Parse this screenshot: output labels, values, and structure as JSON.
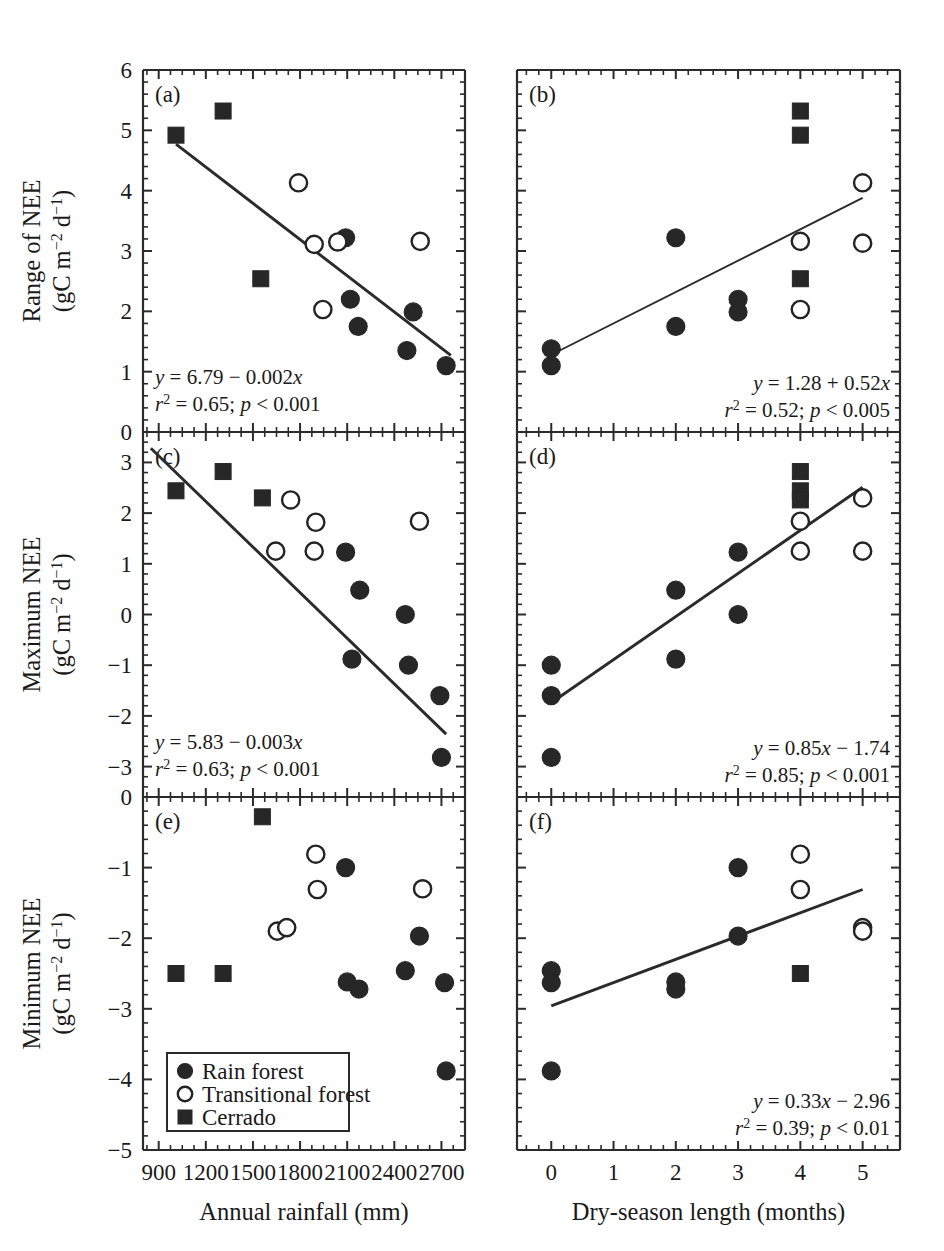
{
  "figure": {
    "title": "",
    "panels": [
      "a",
      "b",
      "c",
      "d",
      "e",
      "f"
    ]
  },
  "axes": {
    "x_left": {
      "label": "Annual rainfall (mm)",
      "ticks": [
        "900",
        "1200",
        "1500",
        "1800",
        "2100",
        "2400",
        "2700"
      ],
      "min": 800,
      "max": 2850,
      "minor_per_major": 3
    },
    "x_right": {
      "label": "Dry-season length (months)",
      "ticks": [
        "0",
        "1",
        "2",
        "3",
        "4",
        "5"
      ],
      "min": -0.55,
      "max": 5.6,
      "minor_per_major": 4
    },
    "y_row1": {
      "label_line1": "Range of NEE",
      "label_line2_pre": "(gC m",
      "label_line2_sup1": "−2",
      "label_line2_mid": " d",
      "label_line2_sup2": "−1",
      "label_line2_post": ")",
      "ticks": [
        "6",
        "5",
        "4",
        "3",
        "2",
        "1",
        "0"
      ],
      "min": 0,
      "max": 6
    },
    "y_row2": {
      "label_line1": "Maximum NEE",
      "label_line2_pre": "(gC m",
      "label_line2_sup1": "−2",
      "label_line2_mid": " d",
      "label_line2_sup2": "−1",
      "label_line2_post": ")",
      "ticks": [
        "3",
        "2",
        "1",
        "0",
        "−1",
        "−2",
        "−3"
      ],
      "min": -3.6,
      "max": 3.6
    },
    "y_row3": {
      "label_line1": "Minimum NEE",
      "label_line2_pre": "(gC m",
      "label_line2_sup1": "−2",
      "label_line2_mid": " d",
      "label_line2_sup2": "−1",
      "label_line2_post": ")",
      "ticks": [
        "0",
        "−1",
        "−2",
        "−3",
        "−4",
        "−5"
      ],
      "min": -5,
      "max": 0
    }
  },
  "legend": {
    "items": [
      {
        "marker": "filled-circle",
        "label": "Rain forest"
      },
      {
        "marker": "open-circle",
        "label": "Transitional forest"
      },
      {
        "marker": "filled-square",
        "label": "Cerrado"
      }
    ]
  },
  "annotations": {
    "a": {
      "eq": "y = 6.79 − 0.002x",
      "stats_r": "r",
      "stats_rest": " = 0.65; p < 0.001"
    },
    "b": {
      "eq": "y = 1.28 + 0.52x",
      "stats_r": "r",
      "stats_rest": " = 0.52; p < 0.005"
    },
    "c": {
      "eq": "y = 5.83 − 0.003x",
      "stats_r": "r",
      "stats_rest": " = 0.63; p < 0.001"
    },
    "d": {
      "eq": "y = 0.85x − 1.74",
      "stats_r": "r",
      "stats_rest": " = 0.85; p < 0.001"
    },
    "e": {
      "eq": "",
      "stats_r": "",
      "stats_rest": ""
    },
    "f": {
      "eq": "y = 0.33x − 2.96",
      "stats_r": "r",
      "stats_rest": " = 0.39; p < 0.01"
    }
  },
  "chart_data": [
    {
      "id": "a",
      "type": "scatter",
      "title": "(a)",
      "xlabel": "Annual rainfall (mm)",
      "ylabel": "Range of NEE (gC m-2 d-1)",
      "xlim": [
        800,
        2850
      ],
      "ylim": [
        0,
        6
      ],
      "grid": false,
      "legend_position": "none",
      "fit": {
        "equation": "y = 6.79 - 0.002x",
        "r2": 0.65,
        "p": "< 0.001",
        "x_start": 1010,
        "x_end": 2760
      },
      "series": [
        {
          "name": "Rain forest",
          "marker": "filled-circle",
          "points": [
            [
              2090,
              3.22
            ],
            [
              2120,
              2.2
            ],
            [
              2170,
              1.75
            ],
            [
              2520,
              1.99
            ],
            [
              2480,
              1.35
            ],
            [
              2730,
              1.1
            ]
          ]
        },
        {
          "name": "Transitional forest",
          "marker": "open-circle",
          "points": [
            [
              1790,
              4.13
            ],
            [
              1890,
              3.11
            ],
            [
              2040,
              3.15
            ],
            [
              1945,
              2.03
            ],
            [
              2565,
              3.16
            ]
          ]
        },
        {
          "name": "Cerrado",
          "marker": "filled-square",
          "points": [
            [
              1010,
              4.92
            ],
            [
              1310,
              5.32
            ],
            [
              1550,
              2.54
            ]
          ]
        }
      ]
    },
    {
      "id": "b",
      "type": "scatter",
      "title": "(b)",
      "xlabel": "Dry-season length (months)",
      "ylabel": "Range of NEE (gC m-2 d-1)",
      "xlim": [
        -0.55,
        5.6
      ],
      "ylim": [
        0,
        6
      ],
      "grid": false,
      "legend_position": "none",
      "fit": {
        "equation": "y = 1.28 + 0.52x",
        "r2": 0.52,
        "p": "< 0.005",
        "x_start": 0,
        "x_end": 5
      },
      "series": [
        {
          "name": "Rain forest",
          "marker": "filled-circle",
          "points": [
            [
              0,
              1.38
            ],
            [
              0,
              1.1
            ],
            [
              2,
              3.22
            ],
            [
              2,
              1.75
            ],
            [
              3,
              2.2
            ],
            [
              3,
              1.99
            ]
          ]
        },
        {
          "name": "Transitional forest",
          "marker": "open-circle",
          "points": [
            [
              4,
              3.16
            ],
            [
              4,
              2.03
            ],
            [
              5,
              4.13
            ],
            [
              5,
              3.13
            ]
          ]
        },
        {
          "name": "Cerrado",
          "marker": "filled-square",
          "points": [
            [
              4,
              5.32
            ],
            [
              4,
              4.92
            ],
            [
              4,
              2.54
            ]
          ]
        }
      ]
    },
    {
      "id": "c",
      "type": "scatter",
      "title": "(c)",
      "xlabel": "Annual rainfall (mm)",
      "ylabel": "Maximum NEE (gC m-2 d-1)",
      "xlim": [
        800,
        2850
      ],
      "ylim": [
        -3.6,
        3.6
      ],
      "grid": false,
      "legend_position": "none",
      "fit": {
        "equation": "y = 5.83 - 0.003x",
        "r2": 0.63,
        "p": "< 0.001",
        "x_start": 850,
        "x_end": 2730
      },
      "series": [
        {
          "name": "Rain forest",
          "marker": "filled-circle",
          "points": [
            [
              2090,
              1.23
            ],
            [
              2180,
              0.48
            ],
            [
              2130,
              -0.88
            ],
            [
              2470,
              0.0
            ],
            [
              2490,
              -1.0
            ],
            [
              2690,
              -1.6
            ],
            [
              2700,
              -2.82
            ]
          ]
        },
        {
          "name": "Transitional forest",
          "marker": "open-circle",
          "points": [
            [
              1740,
              2.26
            ],
            [
              1900,
              1.82
            ],
            [
              1645,
              1.25
            ],
            [
              1890,
              1.25
            ],
            [
              2560,
              1.84
            ]
          ]
        },
        {
          "name": "Cerrado",
          "marker": "filled-square",
          "points": [
            [
              1010,
              2.44
            ],
            [
              1310,
              2.82
            ],
            [
              1560,
              2.3
            ]
          ]
        }
      ]
    },
    {
      "id": "d",
      "type": "scatter",
      "title": "(d)",
      "xlabel": "Dry-season length (months)",
      "ylabel": "Maximum NEE (gC m-2 d-1)",
      "xlim": [
        -0.55,
        5.6
      ],
      "ylim": [
        -3.6,
        3.6
      ],
      "grid": false,
      "legend_position": "none",
      "fit": {
        "equation": "y = 0.85x - 1.74",
        "r2": 0.85,
        "p": "< 0.001",
        "x_start": 0,
        "x_end": 5
      },
      "series": [
        {
          "name": "Rain forest",
          "marker": "filled-circle",
          "points": [
            [
              0,
              -1.0
            ],
            [
              0,
              -1.6
            ],
            [
              0,
              -2.82
            ],
            [
              2,
              0.48
            ],
            [
              2,
              -0.88
            ],
            [
              3,
              1.23
            ],
            [
              3,
              0.0
            ]
          ]
        },
        {
          "name": "Transitional forest",
          "marker": "open-circle",
          "points": [
            [
              4,
              1.84
            ],
            [
              4,
              1.25
            ],
            [
              5,
              2.3
            ],
            [
              5,
              1.25
            ]
          ]
        },
        {
          "name": "Cerrado",
          "marker": "filled-square",
          "points": [
            [
              4,
              2.82
            ],
            [
              4,
              2.44
            ],
            [
              4,
              2.26
            ]
          ]
        }
      ]
    },
    {
      "id": "e",
      "type": "scatter",
      "title": "(e)",
      "xlabel": "Annual rainfall (mm)",
      "ylabel": "Minimum NEE (gC m-2 d-1)",
      "xlim": [
        800,
        2850
      ],
      "ylim": [
        -5,
        0
      ],
      "grid": false,
      "legend_position": "inside-lower-left",
      "fit": null,
      "series": [
        {
          "name": "Rain forest",
          "marker": "filled-circle",
          "points": [
            [
              2090,
              -1.0
            ],
            [
              2100,
              -2.62
            ],
            [
              2175,
              -2.72
            ],
            [
              2470,
              -2.46
            ],
            [
              2560,
              -1.97
            ],
            [
              2720,
              -2.63
            ],
            [
              2730,
              -3.88
            ]
          ]
        },
        {
          "name": "Transitional forest",
          "marker": "open-circle",
          "points": [
            [
              1900,
              -0.81
            ],
            [
              1910,
              -1.31
            ],
            [
              1655,
              -1.9
            ],
            [
              1715,
              -1.85
            ],
            [
              2580,
              -1.3
            ]
          ]
        },
        {
          "name": "Cerrado",
          "marker": "filled-square",
          "points": [
            [
              1010,
              -2.5
            ],
            [
              1310,
              -2.5
            ],
            [
              1560,
              -0.28
            ]
          ]
        }
      ]
    },
    {
      "id": "f",
      "type": "scatter",
      "title": "(f)",
      "xlabel": "Dry-season length (months)",
      "ylabel": "Minimum NEE (gC m-2 d-1)",
      "xlim": [
        -0.55,
        5.6
      ],
      "ylim": [
        -5,
        0
      ],
      "grid": false,
      "legend_position": "none",
      "fit": {
        "equation": "y = 0.33x - 2.96",
        "r2": 0.39,
        "p": "< 0.01",
        "x_start": 0,
        "x_end": 5
      },
      "series": [
        {
          "name": "Rain forest",
          "marker": "filled-circle",
          "points": [
            [
              0,
              -2.46
            ],
            [
              0,
              -2.63
            ],
            [
              0,
              -3.88
            ],
            [
              2,
              -2.62
            ],
            [
              2,
              -2.72
            ],
            [
              3,
              -1.0
            ],
            [
              3,
              -1.97
            ]
          ]
        },
        {
          "name": "Transitional forest",
          "marker": "open-circle",
          "points": [
            [
              4,
              -0.81
            ],
            [
              4,
              -1.31
            ],
            [
              5,
              -1.85
            ],
            [
              5,
              -1.9
            ]
          ]
        },
        {
          "name": "Cerrado",
          "marker": "filled-square",
          "points": [
            [
              4,
              -2.5
            ]
          ]
        }
      ]
    }
  ]
}
